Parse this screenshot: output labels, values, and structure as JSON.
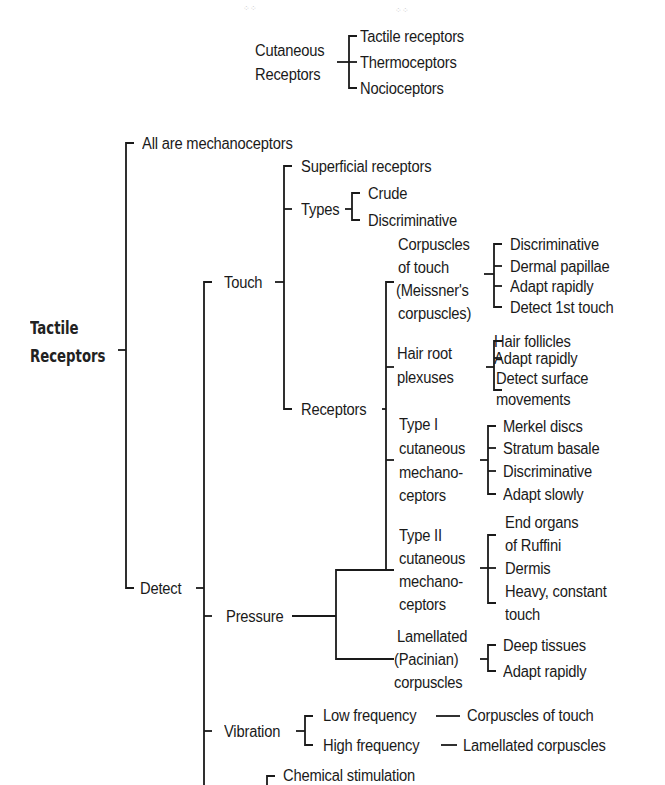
{
  "cutaneous": {
    "root": [
      "Cutaneous",
      "Receptors"
    ],
    "children": [
      "Tactile receptors",
      "Thermoceptors",
      "Nocioceptors"
    ]
  },
  "tactile": {
    "root": [
      "Tactile",
      "Receptors"
    ],
    "all_are": "All are mechanoceptors",
    "detect": "Detect",
    "touch": {
      "label": "Touch",
      "superficial": "Superficial receptors",
      "types": {
        "label": "Types",
        "items": [
          "Crude",
          "Discriminative"
        ]
      },
      "receptors_label": "Receptors"
    },
    "receptor_groups": [
      {
        "name": [
          "Corpuscles",
          "of touch",
          "(Meissner's",
          "corpuscles)"
        ],
        "items": [
          "Discriminative",
          "Dermal papillae",
          "Adapt rapidly",
          "Detect 1st touch"
        ]
      },
      {
        "name": [
          "Hair root",
          "plexuses"
        ],
        "items": [
          "Hair follicles",
          "Adapt rapidly",
          "Detect surface",
          "movements"
        ]
      },
      {
        "name": [
          "Type I",
          "cutaneous",
          "mechano-",
          "ceptors"
        ],
        "items": [
          "Merkel discs",
          "Stratum basale",
          "Discriminative",
          "Adapt slowly"
        ]
      },
      {
        "name": [
          "Type II",
          "cutaneous",
          "mechano-",
          "ceptors"
        ],
        "items": [
          "End organs",
          "of Ruffini",
          "Dermis",
          "Heavy, constant",
          "touch"
        ]
      },
      {
        "name": [
          "Lamellated",
          "(Pacinian)",
          "corpuscles"
        ],
        "items": [
          "Deep tissues",
          "Adapt rapidly"
        ]
      }
    ],
    "pressure": "Pressure",
    "vibration": {
      "label": "Vibration",
      "low": {
        "label": "Low frequency",
        "target": "Corpuscles of touch"
      },
      "high": {
        "label": "High frequency",
        "target": "Lamellated corpuscles"
      }
    },
    "chemical": "Chemical stimulation"
  }
}
